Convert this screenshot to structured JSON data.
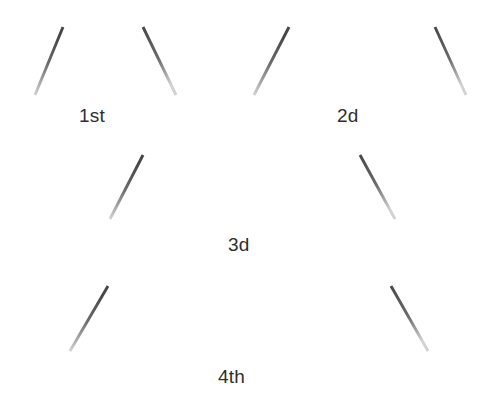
{
  "page": {
    "width": 486,
    "height": 402,
    "background_color": "#ffffff",
    "appearance": "scanned-worksheet",
    "cut_off_text_top": "g"
  },
  "colors": {
    "stroke_dark": "#4a4a4a",
    "stroke_mid": "#6e6e6e",
    "stroke_light": "#bdbdbd",
    "label_text": "#2e2e2e",
    "background": "#ffffff"
  },
  "figures": [
    {
      "label": "1st",
      "index": 1,
      "top_segments": 1,
      "bottom_segments": 2,
      "legs": 2,
      "total_segments": 5,
      "label_position": {
        "x": 79,
        "y": 105
      },
      "geometry": {
        "top_left": {
          "x": 63,
          "y": 27
        },
        "top_right": {
          "x": 143,
          "y": 27
        },
        "bottom_left": {
          "x": 35,
          "y": 95
        },
        "bottom_right": {
          "x": 176,
          "y": 95
        }
      }
    },
    {
      "label": "2d",
      "index": 2,
      "top_segments": 2,
      "bottom_segments": 3,
      "legs": 2,
      "total_segments": 7,
      "label_position": {
        "x": 337,
        "y": 105
      },
      "geometry": {
        "top_left": {
          "x": 289,
          "y": 27
        },
        "top_right": {
          "x": 435,
          "y": 27
        },
        "bottom_left": {
          "x": 254,
          "y": 95
        },
        "bottom_right": {
          "x": 466,
          "y": 95
        }
      }
    },
    {
      "label": "3d",
      "index": 3,
      "top_segments": 3,
      "bottom_segments": 4,
      "legs": 2,
      "total_segments": 9,
      "label_position": {
        "x": 228,
        "y": 234
      },
      "geometry": {
        "top_left": {
          "x": 143,
          "y": 155
        },
        "top_right": {
          "x": 360,
          "y": 155
        },
        "bottom_left": {
          "x": 110,
          "y": 219
        },
        "bottom_right": {
          "x": 395,
          "y": 219
        }
      }
    },
    {
      "label": "4th",
      "index": 4,
      "top_segments": 4,
      "bottom_segments": 5,
      "legs": 2,
      "total_segments": 11,
      "label_position": {
        "x": 218,
        "y": 366
      },
      "geometry": {
        "top_left": {
          "x": 108,
          "y": 286
        },
        "top_right": {
          "x": 391,
          "y": 286
        },
        "bottom_left": {
          "x": 70,
          "y": 351
        },
        "bottom_right": {
          "x": 428,
          "y": 351
        }
      }
    }
  ],
  "chart_data": {
    "type": "table",
    "categories": [
      "1st",
      "2d",
      "3d",
      "4th"
    ],
    "series": [
      {
        "name": "Top segments",
        "values": [
          1,
          2,
          3,
          4
        ]
      },
      {
        "name": "Bottom segments",
        "values": [
          2,
          3,
          4,
          5
        ]
      },
      {
        "name": "Slanted legs",
        "values": [
          2,
          2,
          2,
          2
        ]
      },
      {
        "name": "Total segments",
        "values": [
          5,
          7,
          9,
          11
        ]
      }
    ],
    "xlabel": "Figure",
    "ylabel": "Segment count",
    "grid": false,
    "legend": "none"
  }
}
